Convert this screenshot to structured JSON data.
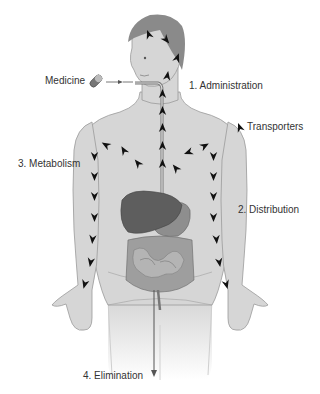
{
  "diagram": {
    "labels": {
      "medicine": "Medicine",
      "administration": "1. Administration",
      "transporters": "Transporters",
      "metabolism": "3. Metabolism",
      "distribution": "2. Distribution",
      "elimination": "4. Elimination"
    },
    "icons": {
      "medicine": "pill-icon",
      "transporter": "arrowhead-icon"
    },
    "colors": {
      "skin": "#d6d6d6",
      "skin_outline": "#9a9a9a",
      "hair": "#8a8a8a",
      "liver": "#5e5e5e",
      "intestine": "#9e9e9e",
      "arrow": "#111111",
      "text": "#333333"
    }
  }
}
